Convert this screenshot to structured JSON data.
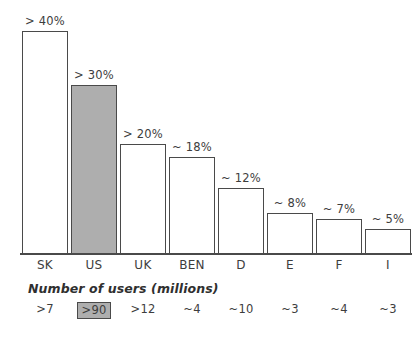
{
  "chart_data": {
    "type": "bar",
    "title": "",
    "xlabel": "",
    "ylabel": "",
    "ylim": [
      0,
      45
    ],
    "grid": false,
    "legend": "none",
    "categories": [
      "SK",
      "US",
      "UK",
      "BEN",
      "D",
      "E",
      "F",
      "I"
    ],
    "values": [
      42,
      33,
      22,
      18,
      12,
      8,
      7,
      5
    ],
    "value_labels": [
      "> 40%",
      "> 30%",
      "> 20%",
      "~ 18%",
      "~ 12%",
      "~ 8%",
      "~ 7%",
      "~ 5%"
    ],
    "highlight_category": "US",
    "series": [
      {
        "name": "Broadband penetration",
        "values": [
          42,
          33,
          22,
          18,
          12,
          8,
          7,
          5
        ]
      }
    ],
    "secondary_axis": {
      "caption": "Number of users (millions)",
      "values": [
        ">7",
        ">90",
        ">12",
        "~4",
        "~10",
        "~3",
        "~4",
        "~3"
      ],
      "highlight_index": 1
    },
    "colors": {
      "bar_fill": "#ffffff",
      "bar_highlight_fill": "#aeaeae",
      "bar_stroke": "#4a4a4a",
      "text": "#3d3d3d",
      "background": "#ffffff"
    }
  },
  "bars": [
    {
      "category": "SK",
      "label": "> 40%",
      "users": ">7",
      "highlight": false,
      "left": 2,
      "height": 223
    },
    {
      "category": "US",
      "label": "> 30%",
      "users": ">90",
      "highlight": true,
      "left": 51,
      "height": 169
    },
    {
      "category": "UK",
      "label": "> 20%",
      "users": ">12",
      "highlight": false,
      "left": 100,
      "height": 110
    },
    {
      "category": "BEN",
      "label": "~ 18%",
      "users": "~4",
      "highlight": false,
      "left": 149,
      "height": 97
    },
    {
      "category": "D",
      "label": "~ 12%",
      "users": "~10",
      "highlight": false,
      "left": 198,
      "height": 66
    },
    {
      "category": "E",
      "label": "~ 8%",
      "users": "~3",
      "highlight": false,
      "left": 247,
      "height": 41
    },
    {
      "category": "F",
      "label": "~ 7%",
      "users": "~4",
      "highlight": false,
      "left": 296,
      "height": 35
    },
    {
      "category": "I",
      "label": "~ 5%",
      "users": "~3",
      "highlight": false,
      "left": 345,
      "height": 25
    }
  ],
  "caption": {
    "users_caption": "Number of users (millions)"
  }
}
